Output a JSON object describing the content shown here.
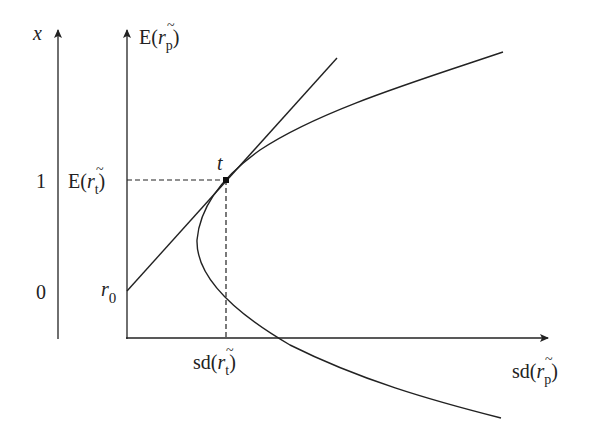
{
  "diagram": {
    "left_axis": {
      "label": "x",
      "ticks": [
        {
          "value": "1",
          "y": 180
        },
        {
          "value": "0",
          "y": 291
        }
      ]
    },
    "y_axis": {
      "label_main": "E(",
      "label_var": "r",
      "label_sub": "p",
      "label_close": ")"
    },
    "x_axis": {
      "label_main": "sd(",
      "label_var": "r",
      "label_sub": "p",
      "label_close": ")"
    },
    "tangent_point": {
      "label": "t"
    },
    "y_tick_t": {
      "label_main": "E(",
      "label_var": "r",
      "label_sub": "t",
      "label_close": ")"
    },
    "x_tick_t": {
      "label_main": "sd(",
      "label_var": "r",
      "label_sub": "t",
      "label_close": ")"
    },
    "intercept": {
      "label_var": "r",
      "label_sub": "0"
    },
    "colors": {
      "line": "#222222"
    }
  }
}
